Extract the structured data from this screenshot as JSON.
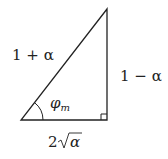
{
  "diagram": {
    "type": "right-triangle",
    "hypotenuse_label": "1 + α",
    "vertical_leg_label": "1 − α",
    "base_label_coef": "2",
    "base_label_radicand": "α",
    "angle_symbol": "φ",
    "angle_subscript": "m",
    "colors": {
      "stroke": "#222222",
      "background": "#ffffff"
    }
  }
}
